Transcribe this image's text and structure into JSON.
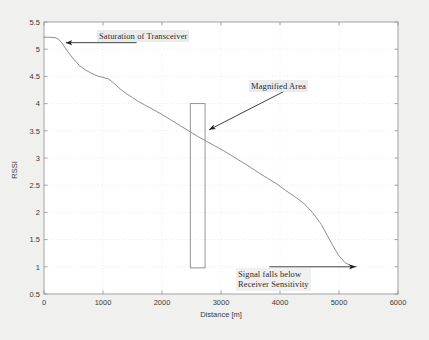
{
  "chart_data": {
    "type": "line",
    "title": "",
    "xlabel": "Distance [m]",
    "ylabel": "RSSI",
    "xlim": [
      0,
      6000
    ],
    "ylim": [
      0.5,
      5.5
    ],
    "grid": true,
    "legend": null,
    "xticks": [
      0,
      1000,
      2000,
      3000,
      4000,
      5000,
      6000
    ],
    "xtick_labels": [
      "0",
      "1000",
      "2000",
      "3000",
      "4000",
      "5000",
      "6000"
    ],
    "yticks": [
      0.5,
      1,
      1.5,
      2,
      2.5,
      3,
      3.5,
      4,
      4.5,
      5,
      5.5
    ],
    "ytick_labels": [
      "0.5",
      "1",
      "1.5",
      "2",
      "2.5",
      "3",
      "3.5",
      "4",
      "4.5",
      "5",
      "5.5"
    ],
    "series": [
      {
        "name": "RSSI vs Distance",
        "color": "#808080",
        "x": [
          0,
          100,
          200,
          250,
          300,
          350,
          420,
          500,
          600,
          700,
          800,
          900,
          1000,
          1100,
          1200,
          1300,
          1400,
          1500,
          1600,
          1700,
          1800,
          1900,
          2000,
          2150,
          2300,
          2450,
          2600,
          2750,
          2900,
          3050,
          3200,
          3350,
          3500,
          3650,
          3800,
          3950,
          4100,
          4250,
          4400,
          4550,
          4700,
          4800,
          4900,
          5000,
          5100,
          5200,
          5300
        ],
        "y": [
          5.22,
          5.22,
          5.21,
          5.18,
          5.12,
          5.04,
          4.93,
          4.82,
          4.7,
          4.62,
          4.56,
          4.51,
          4.48,
          4.45,
          4.36,
          4.26,
          4.18,
          4.11,
          4.04,
          3.98,
          3.92,
          3.86,
          3.8,
          3.7,
          3.6,
          3.5,
          3.4,
          3.31,
          3.22,
          3.13,
          3.03,
          2.93,
          2.83,
          2.72,
          2.62,
          2.52,
          2.4,
          2.29,
          2.17,
          2.0,
          1.78,
          1.58,
          1.38,
          1.2,
          1.08,
          1.02,
          1.0
        ]
      }
    ],
    "annotations": [
      {
        "id": "saturation",
        "text": "Saturation of Transceiver",
        "arrow_from": [
          1570,
          5.12
        ],
        "arrow_to": [
          370,
          5.12
        ],
        "arrow_direction": "left"
      },
      {
        "id": "magnified",
        "text": "Magnified Area",
        "arrow_from": [
          4060,
          4.22
        ],
        "arrow_to": [
          2800,
          3.52
        ],
        "arrow_direction": "down-left"
      },
      {
        "id": "sensitivity",
        "text_line_1": "Signal falls below",
        "text_line_2": "Receiver Sensitivity",
        "arrow_from": [
          3820,
          1.0
        ],
        "arrow_to": [
          5280,
          1.0
        ],
        "arrow_direction": "right"
      }
    ],
    "shapes": [
      {
        "id": "magnified-area-box",
        "type": "rectangle",
        "x_range": [
          2480,
          2730
        ],
        "y_range": [
          0.98,
          4.0
        ],
        "fill": "none",
        "stroke": "#8a8a8a"
      }
    ]
  },
  "figure": {
    "background_color": "#f0f0ee",
    "plot_background_color": "#ffffff",
    "axis_color": "#9a9a9a",
    "grid_color": "#e2e2e2",
    "curve_color": "#808080",
    "annotation_color": "#2b2b2b"
  }
}
